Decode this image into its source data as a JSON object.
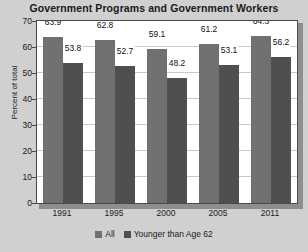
{
  "chart_data": {
    "type": "bar",
    "title": "Government Programs and Government Workers",
    "xlabel": "",
    "ylabel": "Percent of total",
    "categories": [
      "1991",
      "1995",
      "2000",
      "2005",
      "2011"
    ],
    "series": [
      {
        "name": "All",
        "values": [
          63.9,
          62.8,
          59.1,
          61.2,
          64.3
        ],
        "color": "#707070"
      },
      {
        "name": "Younger than Age 62",
        "values": [
          53.8,
          52.7,
          48.2,
          53.1,
          56.2
        ],
        "color": "#4f4f4f"
      }
    ],
    "ylim": [
      0,
      70
    ],
    "yticks": [
      0,
      10,
      20,
      30,
      40,
      50,
      60,
      70
    ],
    "ytick_labels": [
      "0",
      "10",
      "20",
      "30",
      "40",
      "50",
      "60",
      "70"
    ],
    "grid": true,
    "legend_position": "bottom",
    "data_labels": [
      [
        "63.9",
        "53.8"
      ],
      [
        "62.8",
        "52.7"
      ],
      [
        "59.1",
        "48.2"
      ],
      [
        "61.2",
        "53.1"
      ],
      [
        "64.3",
        "56.2"
      ]
    ]
  },
  "colors": {
    "background": "#d0d0d0",
    "plot_background": "#ffffff",
    "frame": "#4a4a4a",
    "gridline": "#c8c8c8",
    "series_all": "#707070",
    "series_younger": "#4f4f4f",
    "text": "#1a1a1a"
  }
}
